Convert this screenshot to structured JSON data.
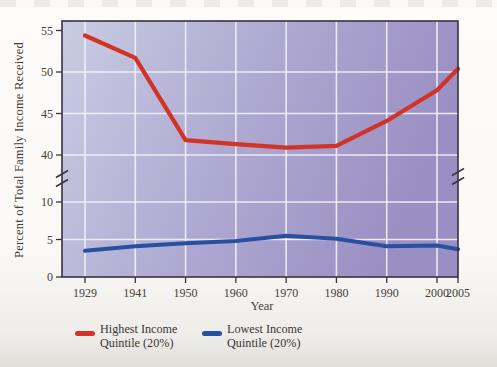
{
  "chart_data": {
    "type": "line",
    "x": [
      1929,
      1941,
      1950,
      1960,
      1970,
      1980,
      1990,
      2000,
      2005
    ],
    "series": [
      {
        "name": "Highest Income Quintile (20%)",
        "color": "#d13327",
        "values": [
          54.4,
          51.7,
          41.8,
          41.3,
          40.9,
          41.1,
          44.1,
          47.8,
          50.4
        ]
      },
      {
        "name": "Lowest Income Quintile (20%)",
        "color": "#2850a0",
        "values": [
          3.5,
          4.1,
          4.5,
          4.8,
          5.5,
          5.1,
          4.1,
          4.2,
          3.7
        ]
      }
    ],
    "title": "",
    "xlabel": "Year",
    "ylabel": "Percent of Total Family Income Received",
    "y_ticks": [
      55,
      50,
      45,
      40,
      10,
      5,
      0
    ],
    "y_gridlines": [
      50,
      45,
      40,
      10,
      5
    ],
    "axis_break": true,
    "y_upper_range": [
      40,
      56.3
    ],
    "y_lower_range": [
      0,
      12
    ],
    "grid": true,
    "legend_position": "bottom"
  },
  "legend": {
    "items": [
      {
        "line1": "Highest Income",
        "line2": "Quintile (20%)",
        "color": "#d13327"
      },
      {
        "line1": "Lowest Income",
        "line2": "Quintile (20%)",
        "color": "#2850a0"
      }
    ]
  },
  "plot_colors": {
    "bg_left": "#c9cce2",
    "bg_mid": "#afaad2",
    "bg_right": "#9a8fc3",
    "gridline": "#f3f1fa",
    "border": "#39333d",
    "text": "#44403a"
  }
}
